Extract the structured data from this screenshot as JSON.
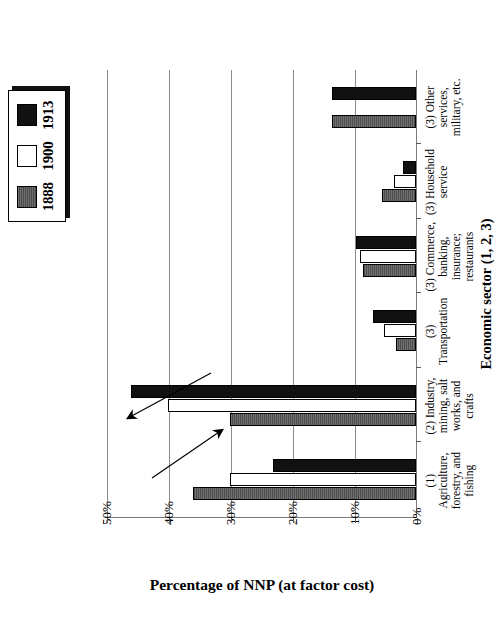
{
  "figure": {
    "xaxis_title": "Economic sector (1, 2, 3)",
    "yaxis_title": "Percentage of NNP (at factor cost)"
  },
  "legend": {
    "items": [
      {
        "label": "1888",
        "swatch": "hatched-gray-swatch",
        "color": "#5b5b5b"
      },
      {
        "label": "1900",
        "swatch": "white-swatch",
        "color": "#ffffff"
      },
      {
        "label": "1913",
        "swatch": "black-swatch",
        "color": "#111111"
      }
    ]
  },
  "annotations": [
    {
      "name": "down-arrow-agriculture",
      "note": "arrow pointing down over category 1"
    },
    {
      "name": "up-arrow-industry",
      "note": "arrow pointing up over category 2"
    }
  ],
  "chart_data": {
    "type": "bar",
    "title": "",
    "xlabel": "Economic sector (1, 2, 3)",
    "ylabel": "Percentage of NNP (at factor cost)",
    "ylim": [
      0,
      50
    ],
    "yticks": [
      "0%",
      "10%",
      "20%",
      "30%",
      "40%",
      "50%"
    ],
    "ytick_values": [
      0,
      10,
      20,
      30,
      40,
      50
    ],
    "grid": true,
    "legend_position": "top-right",
    "categories": [
      "(1) Agriculture, forestry, and fishing",
      "(2) Industry, mining, salt works, and crafts",
      "(3) Transportation",
      "(3) Commerce, banking, insurance; restaurants",
      "(3) Household service",
      "(3) Other services, military, etc."
    ],
    "series": [
      {
        "name": "1888",
        "values": [
          36.0,
          30.0,
          3.2,
          8.5,
          5.5,
          13.5
        ]
      },
      {
        "name": "1900",
        "values": [
          30.0,
          40.0,
          5.2,
          9.0,
          3.6,
          0.0
        ]
      },
      {
        "name": "1913",
        "values": [
          23.0,
          46.0,
          7.0,
          9.6,
          2.1,
          13.5
        ]
      }
    ]
  }
}
